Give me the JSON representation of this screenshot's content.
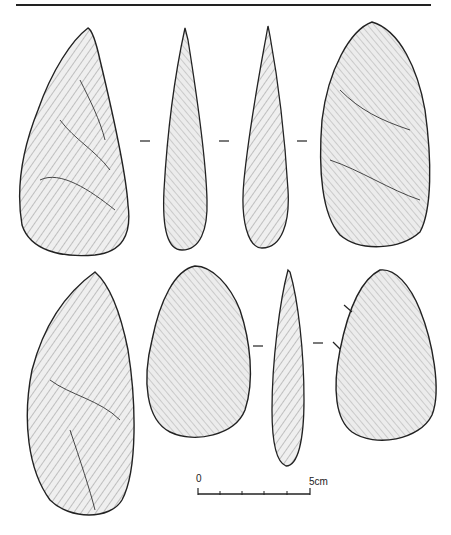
{
  "figure": {
    "type": "archaeological illustration",
    "rows": 2,
    "artifacts": [
      {
        "id": "top-1",
        "view": "face"
      },
      {
        "id": "top-2",
        "view": "profile"
      },
      {
        "id": "top-3",
        "view": "profile"
      },
      {
        "id": "top-4",
        "view": "face"
      },
      {
        "id": "bottom-1",
        "view": "face"
      },
      {
        "id": "bottom-2",
        "view": "face"
      },
      {
        "id": "bottom-3",
        "view": "profile"
      },
      {
        "id": "bottom-4",
        "view": "face"
      }
    ]
  },
  "scale_bar": {
    "start_label": "0",
    "end_label": "5cm",
    "ticks": 6
  },
  "colors": {
    "ink": "#222222",
    "paper": "#ffffff",
    "fill": "#e6e6e6"
  }
}
